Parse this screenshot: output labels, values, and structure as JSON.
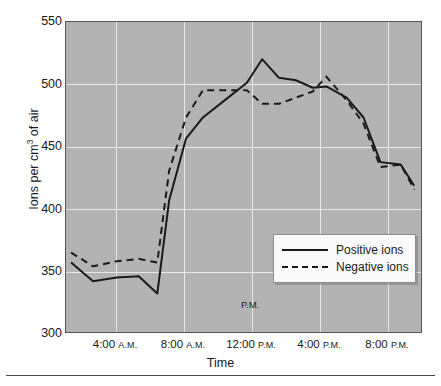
{
  "chart_data": {
    "type": "line",
    "title": "",
    "xlabel": "Time",
    "ylabel": "Ions per cm3 of air",
    "ylabel_prefix": "Ions per cm",
    "ylabel_exponent": "3",
    "ylabel_suffix": " of air",
    "ylim": [
      300,
      550
    ],
    "yticks": [
      300,
      350,
      400,
      450,
      500,
      550
    ],
    "ytick_labels": [
      "300",
      "350",
      "400",
      "450",
      "500",
      "550"
    ],
    "xlim": [
      1,
      22
    ],
    "xticks": [
      4,
      8,
      12,
      16,
      20
    ],
    "xtick_labels": [
      "4:00 A.M.",
      "8:00 A.M.",
      "12:00 P.M.",
      "4:00 P.M.",
      "8:00 P.M."
    ],
    "xtick_times": [
      "4:00",
      "8:00",
      "12:00",
      "4:00",
      "8:00"
    ],
    "xtick_meridiem": [
      "A.M.",
      "A.M.",
      "P.M.",
      "P.M.",
      "P.M."
    ],
    "grid": true,
    "grid_color": "#e8e8e8",
    "plot_background": "#b3b3b3",
    "legend_position": "center",
    "annotations": [
      {
        "text": "P.M.",
        "x": 12.0,
        "y": 322
      }
    ],
    "x": [
      1.3,
      2.6,
      4.0,
      5.3,
      6.4,
      7.1,
      8.1,
      9.1,
      10.4,
      11.7,
      12.6,
      13.6,
      14.6,
      15.6,
      16.4,
      17.6,
      18.6,
      19.6,
      20.8,
      21.6
    ],
    "series": [
      {
        "name": "Positive ions",
        "style": "solid",
        "color": "#1a1a1a",
        "values": [
          356,
          341,
          344,
          345,
          331,
          406,
          456,
          473,
          487,
          501,
          520,
          505,
          503,
          497,
          498,
          489,
          473,
          437,
          435,
          418
        ]
      },
      {
        "name": "Negative ions",
        "style": "dashed",
        "color": "#1a1a1a",
        "values": [
          364,
          353,
          357,
          359,
          356,
          430,
          473,
          495,
          495,
          495,
          484,
          484,
          489,
          494,
          506,
          487,
          468,
          433,
          435,
          415
        ]
      }
    ]
  },
  "legend": {
    "entries": [
      {
        "label": "Positive ions",
        "style": "solid"
      },
      {
        "label": "Negative ions",
        "style": "dashed"
      }
    ]
  }
}
